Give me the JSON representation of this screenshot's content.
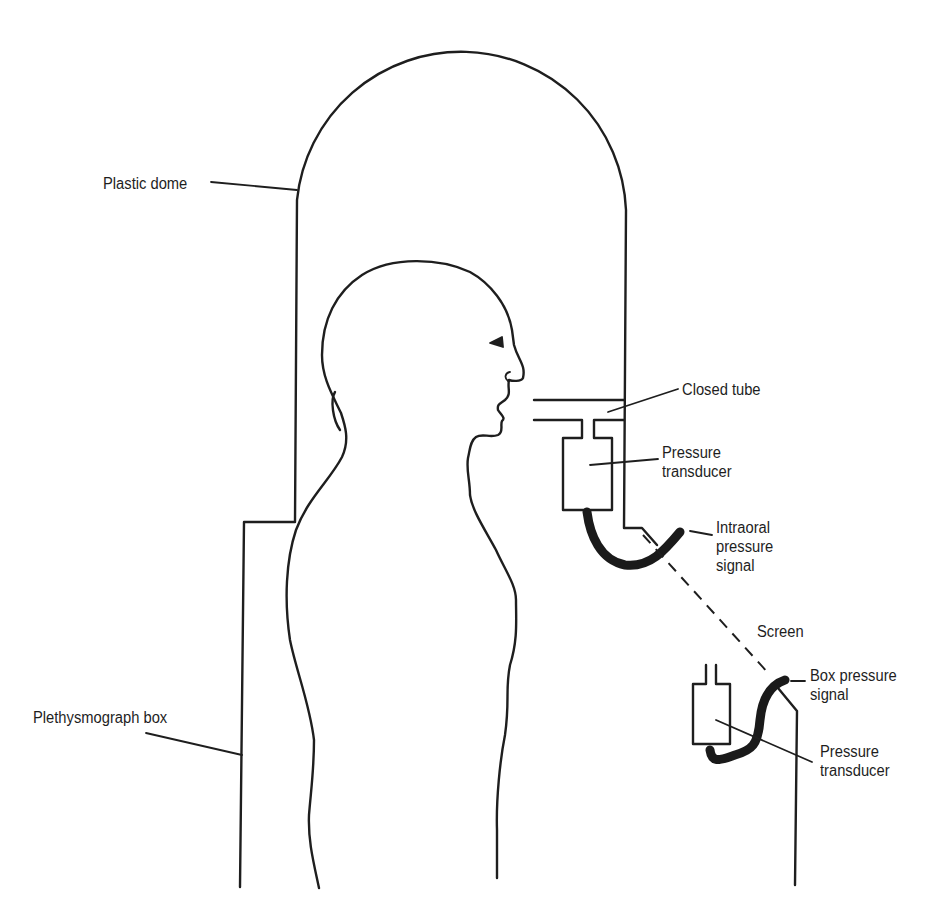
{
  "diagram": {
    "type": "labeled-schematic",
    "colors": {
      "stroke": "#1e1e1e",
      "background": "#ffffff"
    },
    "labels": {
      "plastic_dome": "Plastic dome",
      "closed_tube": "Closed tube",
      "pressure_transducer_top": "Pressure\ntransducer",
      "intraoral_signal": "Intraoral\npressure\nsignal",
      "screen": "Screen",
      "box_pressure_signal": "Box pressure\nsignal",
      "pressure_transducer_bottom": "Pressure\ntransducer",
      "plethysmograph_box": "Plethysmograph box"
    }
  }
}
